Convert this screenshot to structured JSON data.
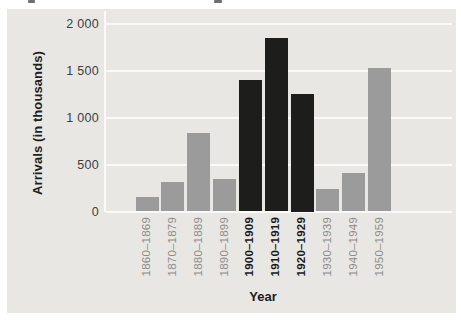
{
  "chart_data": {
    "type": "bar",
    "title": "",
    "xlabel": "Year",
    "ylabel": "Arrivals (in thousands)",
    "categories": [
      "1860–1869",
      "1870–1879",
      "1880–1889",
      "1890–1899",
      "1900–1909",
      "1910–1919",
      "1920–1929",
      "1930–1939",
      "1940–1949",
      "1950–1959"
    ],
    "values": [
      150,
      310,
      840,
      350,
      1400,
      1850,
      1250,
      240,
      410,
      1530
    ],
    "emphasized": [
      false,
      false,
      false,
      false,
      true,
      true,
      true,
      false,
      false,
      false
    ],
    "ytick_values": [
      0,
      500,
      1000,
      1500,
      2000
    ],
    "ytick_labels": [
      "0",
      "500",
      "1 000",
      "1 500",
      "2 000"
    ],
    "ylim": [
      0,
      2130
    ],
    "grid": "horizontal",
    "legend": "none",
    "colors": {
      "panel_background": "#e8e7e4",
      "gridline": "#fbfaf8",
      "bar_default": "#9b9b9b",
      "bar_emphasis": "#1d1d1b",
      "tick_text": "#3e3e3e",
      "category_label_default": "#8d8c8a",
      "category_label_emphasis": "#1a1a1a",
      "axis_title_text": "#1c1c1c"
    }
  }
}
